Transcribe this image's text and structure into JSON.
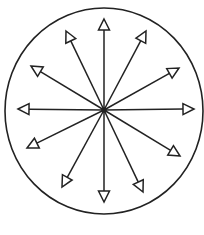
{
  "diagram": {
    "type": "radial-arrows-in-circle",
    "center": [
      104,
      110
    ],
    "circle": {
      "cx": 104,
      "cy": 111,
      "rx": 99,
      "ry": 103,
      "stroke": "#222222"
    },
    "line_color": "#222222",
    "arrow_count": 12,
    "arrows": [
      {
        "name": "arrow-up",
        "tip": [
          104,
          19
        ]
      },
      {
        "name": "arrow-upper-right-1",
        "tip": [
          146,
          31
        ]
      },
      {
        "name": "arrow-upper-right-2",
        "tip": [
          179,
          68
        ]
      },
      {
        "name": "arrow-right",
        "tip": [
          194,
          109
        ]
      },
      {
        "name": "arrow-lower-right-1",
        "tip": [
          180,
          156
        ]
      },
      {
        "name": "arrow-lower-right-2",
        "tip": [
          143,
          192
        ]
      },
      {
        "name": "arrow-down",
        "tip": [
          104,
          202
        ]
      },
      {
        "name": "arrow-lower-left-1",
        "tip": [
          62,
          187
        ]
      },
      {
        "name": "arrow-lower-left-2",
        "tip": [
          27,
          148
        ]
      },
      {
        "name": "arrow-left",
        "tip": [
          18,
          109
        ]
      },
      {
        "name": "arrow-upper-left-1",
        "tip": [
          31,
          66
        ]
      },
      {
        "name": "arrow-upper-left-2",
        "tip": [
          66,
          31
        ]
      }
    ]
  },
  "caption": ""
}
